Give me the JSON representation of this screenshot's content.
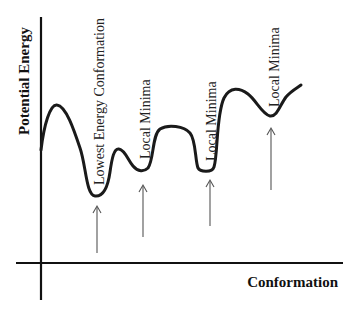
{
  "diagram": {
    "type": "energy-landscape",
    "y_axis_label": "Potential Energy",
    "x_axis_label": "Conformation",
    "annotations": [
      {
        "label": "Lowest Energy Conformation"
      },
      {
        "label": "Local Minima"
      },
      {
        "label": "Local Minima"
      },
      {
        "label": "Local Minima"
      }
    ],
    "colors": {
      "curve": "#1a1a1a",
      "axes": "#111111",
      "arrows": "#555555",
      "background": "#ffffff"
    }
  }
}
